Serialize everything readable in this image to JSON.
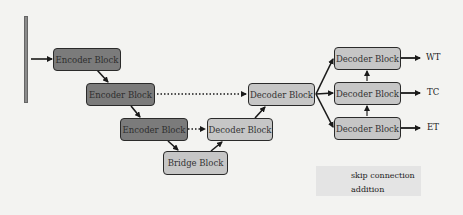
{
  "diagram": {
    "input_bar": {
      "name": "input-volume"
    },
    "encoder_blocks": [
      {
        "label": "Encoder Block",
        "level": 1
      },
      {
        "label": "Encoder Block",
        "level": 2
      },
      {
        "label": "Encoder Block",
        "level": 3
      }
    ],
    "bridge_block": {
      "label": "Bridge Block"
    },
    "decoder_blocks": [
      {
        "label": "Decoder Block",
        "level": 3
      },
      {
        "label": "Decoder Block",
        "level": 2
      }
    ],
    "output_heads": [
      {
        "label": "Decoder Block",
        "output": "WT"
      },
      {
        "label": "Decoder Block",
        "output": "TC"
      },
      {
        "label": "Decoder Block",
        "output": "ET"
      }
    ]
  },
  "legend": {
    "items": [
      {
        "symbol": "dotted-arrow",
        "label": "skip connection"
      },
      {
        "symbol": "up-arrow",
        "label": "addition"
      }
    ]
  },
  "colors": {
    "encoder_fill": "#7b7b7b",
    "decoder_fill": "#c6c6c6",
    "border": "#2a2a2a",
    "background": "#f3f3f1",
    "legend_bg": "#e4e4e4"
  }
}
